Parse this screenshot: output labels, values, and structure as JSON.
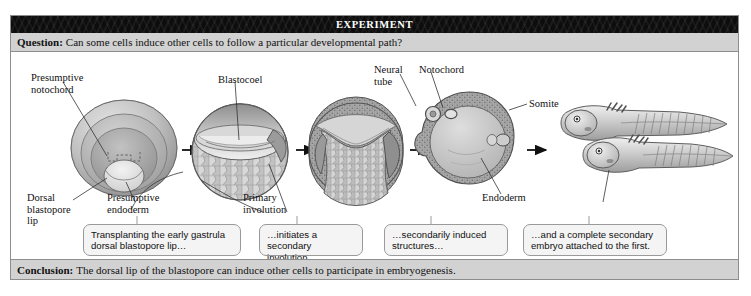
{
  "figure": {
    "banner_title": "EXPERIMENT",
    "question_lead": "Question:",
    "question_text": "Can some cells induce other cells to follow a particular developmental path?",
    "conclusion_lead": "Conclusion:",
    "conclusion_text": "The dorsal lip of the blastopore can induce other cells to participate in embryogenesis."
  },
  "labels": [
    {
      "id": "presumptive-notochord",
      "text": "Presumptive\nnotochord"
    },
    {
      "id": "dorsal-blastopore-lip",
      "text": "Dorsal\nblastopore\nlip"
    },
    {
      "id": "presumptive-endoderm",
      "text": "Presumptive\nendoderm"
    },
    {
      "id": "blastocoel",
      "text": "Blastocoel"
    },
    {
      "id": "primary-involution",
      "text": "Primary\ninvolution"
    },
    {
      "id": "neural-tube",
      "text": "Neural\ntube"
    },
    {
      "id": "notochord",
      "text": "Notochord"
    },
    {
      "id": "somite",
      "text": "Somite"
    },
    {
      "id": "endoderm",
      "text": "Endoderm"
    }
  ],
  "captions": [
    {
      "id": "caption-1",
      "line1": "Transplanting the early gastrula",
      "line2": "dorsal blastopore lip…"
    },
    {
      "id": "caption-2",
      "line1": "…initiates a secondary",
      "line2": "involution…"
    },
    {
      "id": "caption-3",
      "line1": "…secondarily induced",
      "line2": "structures…"
    },
    {
      "id": "caption-4",
      "line1": "…and a complete secondary",
      "line2": "embryo attached to the first."
    }
  ],
  "stages": [
    {
      "id": "stage-1-early-gastrula",
      "name": "Early gastrula with dorsal blastopore lip"
    },
    {
      "id": "stage-2-blastula-section",
      "name": "Sectioned embryo showing blastocoel"
    },
    {
      "id": "stage-3-involution",
      "name": "Embryo undergoing primary involution"
    },
    {
      "id": "stage-4-neurula-section",
      "name": "Neurula cross-section with neural tube, notochord, somite, endoderm"
    },
    {
      "id": "stage-5-double-larva",
      "name": "Two conjoined tadpole larvae"
    }
  ],
  "colors": {
    "banner_bg": "#0d0d0d",
    "bar_bg": "#d2d2d2",
    "frame_border": "#8d8d8d",
    "callout_bg": "#f4f4f4",
    "ink": "#111111"
  }
}
